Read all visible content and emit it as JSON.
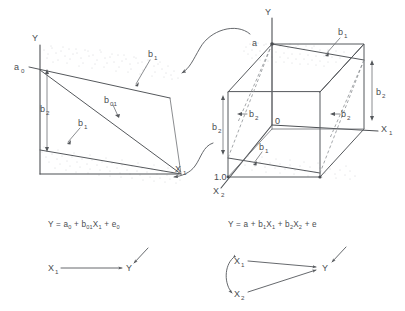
{
  "figure": {
    "background_color": "#ffffff",
    "line_color": "#55585c",
    "scatter_color": "#aaadb1",
    "dash_color": "#8d9094"
  },
  "left_panel": {
    "name": "simple-regression-plane",
    "axes": {
      "y_label": "Y",
      "x_label": "X",
      "x_subscript": "1"
    },
    "annotations": {
      "intercept": "a",
      "intercept_subscript": "0",
      "slope_main": "b",
      "slope_main_subscript": "01",
      "band_top": "b",
      "band_top_subscript": "1",
      "band_bottom": "b",
      "band_bottom_subscript": "1",
      "spread": "b",
      "spread_subscript": "2"
    },
    "equation": {
      "parts": [
        {
          "t": "Y = a",
          "sub": ""
        },
        {
          "t": "",
          "sub": "0"
        },
        {
          "t": " + b",
          "sub": ""
        },
        {
          "t": "",
          "sub": "01"
        },
        {
          "t": "X",
          "sub": ""
        },
        {
          "t": "",
          "sub": "1"
        },
        {
          "t": " + e",
          "sub": ""
        },
        {
          "t": "",
          "sub": "0"
        }
      ],
      "plain": "Y = a0 + b01X1 + e0"
    },
    "path_diagram": {
      "from_label": "X",
      "from_subscript": "1",
      "to_label": "Y",
      "error_arrow": "residual-arrow"
    }
  },
  "right_panel": {
    "name": "multiple-regression-cube",
    "axes": {
      "y_label": "Y",
      "x1_label": "X",
      "x1_subscript": "1",
      "x2_label": "X",
      "x2_subscript": "2",
      "origin_label": "0",
      "unit_label": "1.0"
    },
    "annotations": {
      "intercept": "a",
      "top_slope": "b",
      "top_slope_subscript": "1",
      "bottom_slope": "b",
      "bottom_slope_subscript": "1",
      "b2_left_outer": "b",
      "b2_left_outer_subscript": "2",
      "b2_left_inner": "b",
      "b2_left_inner_subscript": "2",
      "b2_right_inner": "b",
      "b2_right_inner_subscript": "2",
      "b2_right_outer": "b",
      "b2_right_outer_subscript": "2"
    },
    "equation": {
      "plain": "Y = a + b1X1 + b2X2 + e"
    },
    "path_diagram": {
      "x1_label": "X",
      "x1_subscript": "1",
      "x2_label": "X",
      "x2_subscript": "2",
      "to_label": "Y",
      "correlation_arrow": "curved-double-arrow",
      "error_arrow": "residual-arrow"
    }
  },
  "connectors": {
    "top_curve": "curved-arrow-right-to-left",
    "bottom_curve": "curved-arrow-right-to-left"
  }
}
